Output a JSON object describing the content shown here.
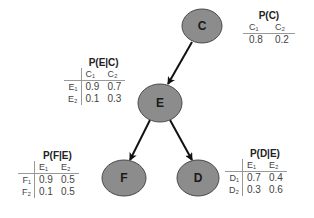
{
  "colors": {
    "node_fill": "#8c8c8c",
    "node_stroke": "#4a4a4a",
    "edge": "#111111",
    "background": "#ffffff"
  },
  "nodes": [
    {
      "id": "C",
      "label": "C",
      "cx": 202,
      "cy": 26,
      "rx": 20,
      "ry": 17
    },
    {
      "id": "E",
      "label": "E",
      "cx": 160,
      "cy": 103,
      "rx": 22,
      "ry": 19
    },
    {
      "id": "F",
      "label": "F",
      "cx": 124,
      "cy": 178,
      "rx": 22,
      "ry": 18
    },
    {
      "id": "D",
      "label": "D",
      "cx": 198,
      "cy": 178,
      "rx": 21,
      "ry": 18
    }
  ],
  "edges": [
    {
      "from": "C",
      "to": "E"
    },
    {
      "from": "E",
      "to": "F"
    },
    {
      "from": "E",
      "to": "D"
    }
  ],
  "cpts": {
    "pc": {
      "title": "P(C)",
      "cols": [
        "C₁",
        "C₂"
      ],
      "rows": [
        {
          "label": "",
          "values": [
            "0.8",
            "0.2"
          ]
        }
      ]
    },
    "pec": {
      "title": "P(E|C)",
      "cols": [
        "C₁",
        "C₂"
      ],
      "rows": [
        {
          "label": "E₁",
          "values": [
            "0.9",
            "0.7"
          ]
        },
        {
          "label": "E₂",
          "values": [
            "0.1",
            "0.3"
          ]
        }
      ]
    },
    "pfe": {
      "title": "P(F|E)",
      "cols": [
        "E₁",
        "E₂"
      ],
      "rows": [
        {
          "label": "F₁",
          "values": [
            "0.9",
            "0.5"
          ]
        },
        {
          "label": "F₂",
          "values": [
            "0.1",
            "0.5"
          ]
        }
      ]
    },
    "pde": {
      "title": "P(D|E)",
      "cols": [
        "E₁",
        "E₂"
      ],
      "rows": [
        {
          "label": "D₁",
          "values": [
            "0.7",
            "0.4"
          ]
        },
        {
          "label": "D₂",
          "values": [
            "0.3",
            "0.6"
          ]
        }
      ]
    }
  }
}
